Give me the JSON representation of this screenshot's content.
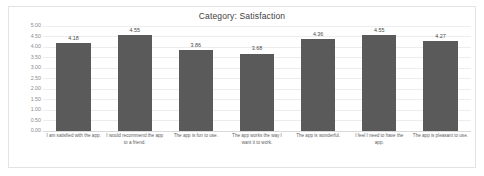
{
  "chart": {
    "title": "Category: Satisfaction",
    "bar_color": "#5a5a5a",
    "grid_color": "#ededed",
    "axis_text_color": "#8a8a8a",
    "frame_color": "#e3e3e3"
  },
  "chart_data": {
    "type": "bar",
    "title": "Category: Satisfaction",
    "xlabel": "",
    "ylabel": "",
    "ylim": [
      0,
      5
    ],
    "ytick_step": 0.5,
    "ytick_labels": [
      "5.00",
      "4.50",
      "4.00",
      "3.50",
      "3.00",
      "2.50",
      "2.00",
      "1.50",
      "1.00",
      "0.50",
      "0.00"
    ],
    "grid": true,
    "legend": false,
    "categories": [
      "I am satisfied with the app.",
      "I would recommend the app to a friend.",
      "The app is fun to use.",
      "The app works the way I want it to work.",
      "The app is wonderful.",
      "I feel I need to have the app.",
      "The app is pleasant to use."
    ],
    "values": [
      4.18,
      4.55,
      3.86,
      3.68,
      4.36,
      4.55,
      4.27
    ],
    "data_labels": [
      "4.18",
      "4.55",
      "3.86",
      "3.68",
      "4.36",
      "4.55",
      "4.27"
    ]
  }
}
